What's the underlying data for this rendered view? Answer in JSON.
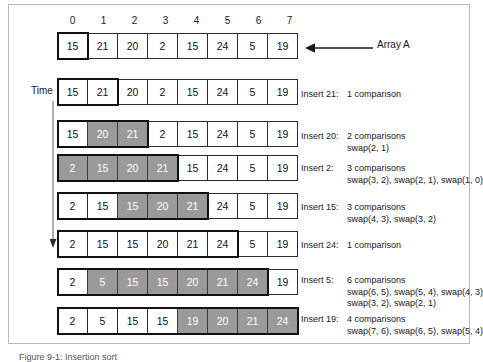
{
  "figure": {
    "caption": "Figure 9-1: Insertion sort",
    "array_label": "Array A",
    "time_label": "Time",
    "column_headers": [
      "0",
      "1",
      "2",
      "3",
      "4",
      "5",
      "6",
      "7"
    ],
    "shade_color": "#9a9a9a",
    "border_color": "#111111"
  },
  "rows": [
    {
      "name": "array-a",
      "values": [
        "15",
        "21",
        "20",
        "2",
        "15",
        "24",
        "5",
        "19"
      ],
      "shaded": [],
      "sorted_end": 1,
      "note": null,
      "note_sub1": null,
      "note_sub2": null
    },
    {
      "name": "insert-21",
      "values": [
        "15",
        "21",
        "20",
        "2",
        "15",
        "24",
        "5",
        "19"
      ],
      "shaded": [],
      "sorted_end": 2,
      "note_label": "Insert 21:",
      "note": "1 comparison",
      "note_sub1": null,
      "note_sub2": null
    },
    {
      "name": "insert-20",
      "values": [
        "15",
        "20",
        "21",
        "2",
        "15",
        "24",
        "5",
        "19"
      ],
      "shaded": [
        1,
        2
      ],
      "sorted_end": 3,
      "note_label": "Insert 20:",
      "note": "2 comparisons",
      "note_sub1": "swap(2, 1)",
      "note_sub2": null
    },
    {
      "name": "insert-2",
      "values": [
        "2",
        "15",
        "20",
        "21",
        "15",
        "24",
        "5",
        "19"
      ],
      "shaded": [
        0,
        1,
        2,
        3
      ],
      "sorted_end": 4,
      "note_label": "Insert 2:",
      "note": "3 comparisons",
      "note_sub1": "swap(3, 2), swap(2, 1), swap(1, 0)",
      "note_sub2": null
    },
    {
      "name": "insert-15",
      "values": [
        "2",
        "15",
        "15",
        "20",
        "21",
        "24",
        "5",
        "19"
      ],
      "shaded": [
        2,
        3,
        4
      ],
      "sorted_end": 5,
      "note_label": "Insert 15:",
      "note": "3 comparisons",
      "note_sub1": "swap(4, 3), swap(3, 2)",
      "note_sub2": null
    },
    {
      "name": "insert-24",
      "values": [
        "2",
        "15",
        "15",
        "20",
        "21",
        "24",
        "5",
        "19"
      ],
      "shaded": [],
      "sorted_end": 6,
      "note_label": "Insert 24:",
      "note": "1 comparison",
      "note_sub1": null,
      "note_sub2": null
    },
    {
      "name": "insert-5",
      "values": [
        "2",
        "5",
        "15",
        "15",
        "20",
        "21",
        "24",
        "19"
      ],
      "shaded": [
        1,
        2,
        3,
        4,
        5,
        6
      ],
      "sorted_end": 7,
      "note_label": "Insert 5:",
      "note": "6 comparisons",
      "note_sub1": "swap(6, 5), swap(5, 4), swap(4, 3)",
      "note_sub2": "swap(3, 2), swap(2, 1)"
    },
    {
      "name": "insert-19",
      "values": [
        "2",
        "5",
        "15",
        "15",
        "19",
        "20",
        "21",
        "24"
      ],
      "shaded": [
        4,
        5,
        6,
        7
      ],
      "sorted_end": 8,
      "note_label": "Insert 19:",
      "note": "4 comparisons",
      "note_sub1": "swap(7, 6), swap(6, 5), swap(5, 4)",
      "note_sub2": null
    }
  ]
}
